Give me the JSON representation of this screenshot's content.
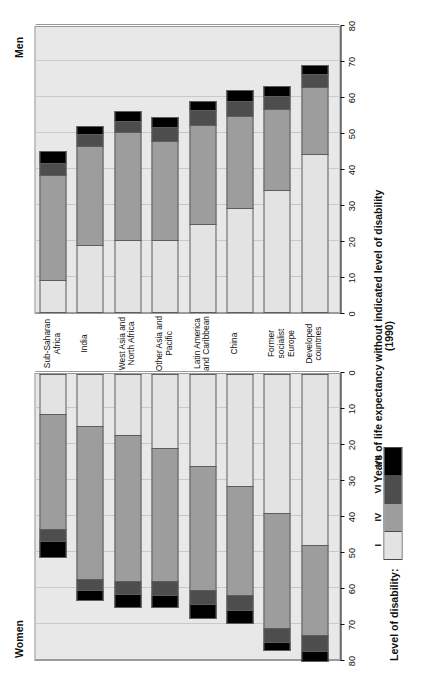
{
  "figure": {
    "women_label": "Women",
    "men_label": "Men",
    "axis_title": "Years of life expectancy without indicated level of disability (1990)",
    "legend_title": "Level of disability:"
  },
  "chart_data": {
    "type": "bar",
    "title": "",
    "subtitle": "",
    "xlabel": "Years of life expectancy without indicated level of disability (1990)",
    "ylabel": "",
    "xlim": [
      0,
      80
    ],
    "ticks": [
      0,
      10,
      20,
      30,
      40,
      50,
      60,
      70,
      80
    ],
    "grid": true,
    "orientation": "horizontal-butterfly",
    "legend_position": "bottom-left",
    "categories": [
      "Sub-Saharan Africa",
      "India",
      "West Asia and North Africa",
      "Other Asia and Pacific",
      "Latin America and Caribbean",
      "China",
      "Former socialist Europe",
      "Developed countries"
    ],
    "levels": [
      "I",
      "IV",
      "VI",
      "VII"
    ],
    "level_colors": {
      "I": "#e3e3e3",
      "IV": "#9d9d9d",
      "VI": "#4d4d4d",
      "VII": "#000000"
    },
    "panels": [
      {
        "name": "Women",
        "series": [
          {
            "name": "I",
            "values": [
              11.0,
              14.5,
              17.0,
              20.5,
              25.5,
              31.0,
              38.5,
              47.5
            ]
          },
          {
            "name": "IV",
            "values": [
              32.0,
              42.5,
              40.5,
              37.0,
              34.5,
              30.5,
              32.0,
              25.0
            ]
          },
          {
            "name": "VI",
            "values": [
              3.5,
              3.0,
              3.5,
              4.0,
              4.0,
              4.0,
              4.0,
              4.5
            ]
          },
          {
            "name": "VII",
            "values": [
              4.5,
              3.0,
              4.0,
              3.5,
              4.0,
              4.0,
              2.5,
              3.0
            ]
          }
        ],
        "totals": [
          51.0,
          63.0,
          65.0,
          65.0,
          68.0,
          69.5,
          77.0,
          80.0
        ]
      },
      {
        "name": "Men",
        "series": [
          {
            "name": "I",
            "values": [
              9.0,
              18.5,
              20.0,
              20.0,
              24.5,
              29.0,
              34.0,
              44.0
            ]
          },
          {
            "name": "IV",
            "values": [
              29.0,
              27.5,
              30.0,
              27.5,
              27.5,
              25.5,
              22.5,
              18.5
            ]
          },
          {
            "name": "VI",
            "values": [
              3.5,
              3.5,
              3.0,
              4.0,
              4.0,
              4.0,
              3.5,
              3.5
            ]
          },
          {
            "name": "VII",
            "values": [
              3.5,
              2.5,
              3.0,
              3.0,
              3.0,
              3.5,
              3.0,
              3.0
            ]
          }
        ],
        "totals": [
          45.0,
          52.0,
          56.0,
          54.5,
          59.0,
          62.0,
          63.0,
          69.0
        ]
      }
    ]
  }
}
